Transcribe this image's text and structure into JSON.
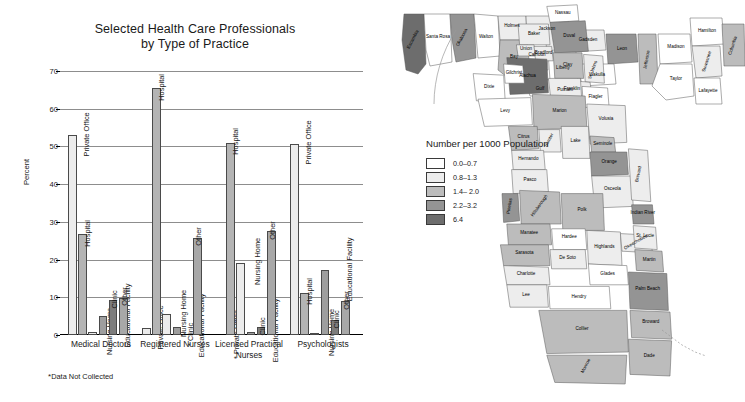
{
  "chart_data": {
    "type": "bar",
    "title": "Selected Health Care Professionals by Type of Practice",
    "title_line1": "Selected Health Care Professionals",
    "title_line2": "by Type of Practice",
    "xlabel": "",
    "ylabel": "Percent",
    "ylim": [
      0,
      70
    ],
    "yticks": [
      "0",
      "10",
      "20",
      "30",
      "40",
      "50",
      "60",
      "70"
    ],
    "grid": true,
    "legend_position": "none",
    "footnote": "Data Not Collected",
    "footnote_marker": "*",
    "not_collected_marker": "*",
    "categories": [
      "Medical Doctors",
      "Registered Nurses",
      "Licensed Practical Nurses",
      "Psychologists"
    ],
    "category_lines": [
      [
        "Medical Doctors"
      ],
      [
        "Registered Nurses"
      ],
      [
        "Licensed Practical",
        "Nurses"
      ],
      [
        "Psychologists"
      ]
    ],
    "series": [
      {
        "name": "Private Office",
        "values": [
          53.0,
          1.8,
          null,
          50.7
        ]
      },
      {
        "name": "Hospital",
        "values": [
          26.7,
          65.5,
          51.0,
          11.2
        ]
      },
      {
        "name": "Nursing Home",
        "values": [
          0.7,
          5.5,
          19.2,
          0.2
        ]
      },
      {
        "name": "Educational Facility",
        "values": [
          5.0,
          2.2,
          0.9,
          17.2
        ]
      },
      {
        "name": "Clinic",
        "values": [
          9.2,
          null,
          2.1,
          3.9
        ]
      },
      {
        "name": "Other",
        "values": [
          9.9,
          25.8,
          27.5,
          9.0
        ]
      }
    ],
    "bar_colors": [
      "#ececec",
      "#b4b4b4",
      "#ececec",
      "#9e9e9e",
      "#7d7d7d",
      "#a8a8a8"
    ]
  },
  "map": {
    "title": "Number per 1000 Population",
    "legend": [
      {
        "label": "0.0–0.7",
        "color": "#ffffff"
      },
      {
        "label": "0.8–1.3",
        "color": "#ededed"
      },
      {
        "label": "1.4– 2.0",
        "color": "#bcbcbc"
      },
      {
        "label": "2.2–3.2",
        "color": "#949494"
      },
      {
        "label": "6.4",
        "color": "#6d6d6d"
      }
    ],
    "counties": [
      "Escambia",
      "Santa Rosa",
      "Okaloosa",
      "Walton",
      "Holmes",
      "Jackson",
      "Bay",
      "Calhoun",
      "Gadsden",
      "Liberty",
      "Leon",
      "Wakulla",
      "Franklin",
      "Gulf",
      "Jefferson",
      "Madison",
      "Taylor",
      "Hamilton",
      "Suwannee",
      "Lafayette",
      "Columbia",
      "Baker",
      "Nassau",
      "Duval",
      "Union",
      "Bradford",
      "Clay",
      "St. Johns",
      "Alachua",
      "Dixie",
      "Gilchrist",
      "Levy",
      "Putnam",
      "Flagler",
      "Marion",
      "Volusia",
      "Citrus",
      "Sumter",
      "Lake",
      "Seminole",
      "Orange",
      "Hernando",
      "Pasco",
      "Osceola",
      "Brevard",
      "Pinellas",
      "Hillsborough",
      "Polk",
      "Manatee",
      "Hardee",
      "Highlands",
      "Indian River",
      "Okeechobee",
      "St. Lucie",
      "Sarasota",
      "De Soto",
      "Martin",
      "Charlotte",
      "Glades",
      "Palm Beach",
      "Lee",
      "Hendry",
      "Broward",
      "Collier",
      "Dade",
      "Monroe"
    ]
  }
}
